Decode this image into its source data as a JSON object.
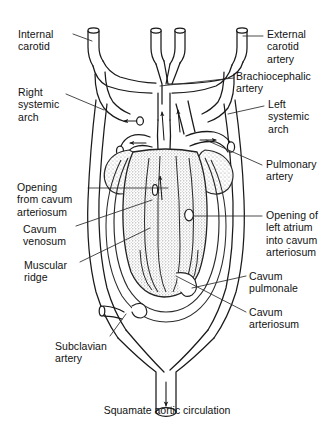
{
  "figure": {
    "name": "squamate-aortic-circulation-diagram",
    "caption": "Squamate aortic circulation",
    "style": {
      "background": "#ffffff",
      "ink": "#1a1a1a",
      "leader_line": "#2b2b2b",
      "ventricle_stipple": "#8a8a8a",
      "vessel_fill": "#ffffff",
      "shadow_tint": "#d6d6d6"
    }
  },
  "labels": {
    "internal_carotid": {
      "text": "Internal\ncarotid",
      "side": "left",
      "x": 18,
      "y": 28
    },
    "right_systemic_arch": {
      "text": "Right\nsystemic\narch",
      "side": "left",
      "x": 18,
      "y": 86
    },
    "opening_from_cavum_arteriosum": {
      "text": "Opening\nfrom cavum\narteriosum",
      "side": "left",
      "x": 17,
      "y": 181
    },
    "cavum_venosum": {
      "text": "Cavum\nvenosum",
      "side": "left",
      "x": 23,
      "y": 223
    },
    "muscular_ridge": {
      "text": "Muscular\nridge",
      "side": "left",
      "x": 24,
      "y": 259
    },
    "subclavian_artery": {
      "text": "Subclavian\nartery",
      "side": "left",
      "x": 55,
      "y": 340
    },
    "external_carotid_artery": {
      "text": "External\ncarotid\nartery",
      "side": "right",
      "x": 267,
      "y": 28
    },
    "brachiocephalic_artery": {
      "text": "Brachiocephalic\nartery",
      "side": "right",
      "x": 236,
      "y": 70
    },
    "left_systemic_arch": {
      "text": "Left\nsystemic\narch",
      "side": "right",
      "x": 268,
      "y": 98
    },
    "pulmonary_artery": {
      "text": "Pulmonary\nartery",
      "side": "right",
      "x": 266,
      "y": 158
    },
    "opening_of_left_atrium": {
      "text": "Opening of\nleft atrium\ninto cavum\narteriosum",
      "side": "right",
      "x": 266,
      "y": 209
    },
    "cavum_pulmonale": {
      "text": "Cavum\npulmonale",
      "side": "right",
      "x": 249,
      "y": 270
    },
    "cavum_arteriosum": {
      "text": "Cavum\narteriosum",
      "side": "right",
      "x": 249,
      "y": 306
    }
  }
}
